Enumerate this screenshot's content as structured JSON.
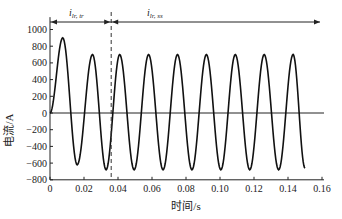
{
  "chart_data": {
    "type": "line",
    "title": "",
    "xlabel": "时间/s",
    "ylabel": "电流/A",
    "xlim": [
      0,
      0.16
    ],
    "ylim": [
      -800,
      1100
    ],
    "xticks": [
      "0",
      "0.02",
      "0.04",
      "0.06",
      "0.08",
      "0.10",
      "0.12",
      "0.14",
      "0.16"
    ],
    "yticks": [
      "1000",
      "800",
      "600",
      "400",
      "200",
      "0",
      "-200",
      "-400",
      "-600",
      "-800"
    ],
    "grid": false,
    "legend": null,
    "series": [
      {
        "name": "i_lr",
        "description": "Damped-start sinusoidal current, period ~0.017 s",
        "x": [
          0,
          0.0075,
          0.016,
          0.025,
          0.033,
          0.041,
          0.0495,
          0.058,
          0.0665,
          0.075,
          0.0835,
          0.092,
          0.1005,
          0.109,
          0.1175,
          0.126,
          0.1345,
          0.143,
          0.15
        ],
        "values": [
          0,
          900,
          -620,
          700,
          -680,
          700,
          -680,
          700,
          -680,
          700,
          -680,
          700,
          -680,
          700,
          -680,
          700,
          -680,
          700,
          -660
        ]
      }
    ],
    "annotations": [
      {
        "type": "vline-dashed",
        "x": 0.036,
        "label": ""
      },
      {
        "type": "double-arrow",
        "x_from": 0,
        "x_to": 0.036,
        "label": "i_lr,tr"
      },
      {
        "type": "arrow",
        "x_from": 0.036,
        "x_to": 0.16,
        "label": "i_lr,ss"
      }
    ]
  },
  "labels": {
    "xlabel": "时间/s",
    "ylabel": "电流/A",
    "tr_main": "i",
    "tr_sub": "lr, tr",
    "ss_main": "i",
    "ss_sub": "lr, ss"
  }
}
